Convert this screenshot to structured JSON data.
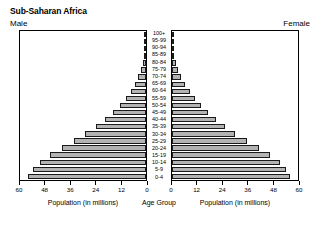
{
  "header": {
    "title": "Sub-Saharan Africa",
    "left_label": "Male",
    "right_label": "Female"
  },
  "axis": {
    "left_caption": "Population (in millions)",
    "right_caption": "Population (in millions)",
    "center_caption": "Age Group",
    "left_ticks": [
      "60",
      "48",
      "36",
      "24",
      "12",
      "0"
    ],
    "right_ticks": [
      "0",
      "12",
      "24",
      "36",
      "48",
      "60"
    ]
  },
  "style": {
    "bar_fill": "#b3b3b3",
    "bar_stroke": "#1a1a1a",
    "panel_stroke": "#000000",
    "background": "#ffffff"
  },
  "chart_data": {
    "type": "bar",
    "subtype": "population-pyramid",
    "title": "Sub-Saharan Africa",
    "xlabel": "Population (in millions)",
    "ylabel": "Age Group",
    "xlim": [
      0,
      60
    ],
    "xticks": [
      0,
      12,
      24,
      36,
      48,
      60
    ],
    "grid": false,
    "legend": "none",
    "orientation": "horizontal",
    "categories": [
      "100+",
      "95-99",
      "90-94",
      "85-89",
      "80-84",
      "75-79",
      "70-74",
      "65-69",
      "60-64",
      "55-59",
      "50-54",
      "45-49",
      "40-44",
      "35-39",
      "30-34",
      "25-29",
      "20-24",
      "15-19",
      "10-14",
      "5-9",
      "0-4"
    ],
    "series": [
      {
        "name": "Male",
        "side": "left",
        "values": [
          0.05,
          0.15,
          0.4,
          0.8,
          1.5,
          2.4,
          3.6,
          5.2,
          7.2,
          9.6,
          12.4,
          15.8,
          19.6,
          24.0,
          29.0,
          34.4,
          40.2,
          45.8,
          50.6,
          54.0,
          56.0
        ]
      },
      {
        "name": "Female",
        "side": "right",
        "values": [
          0.07,
          0.2,
          0.5,
          1.0,
          1.9,
          3.0,
          4.4,
          6.2,
          8.4,
          10.8,
          13.6,
          17.0,
          20.8,
          25.2,
          30.2,
          35.6,
          41.2,
          46.6,
          51.2,
          54.4,
          56.2
        ]
      }
    ]
  }
}
